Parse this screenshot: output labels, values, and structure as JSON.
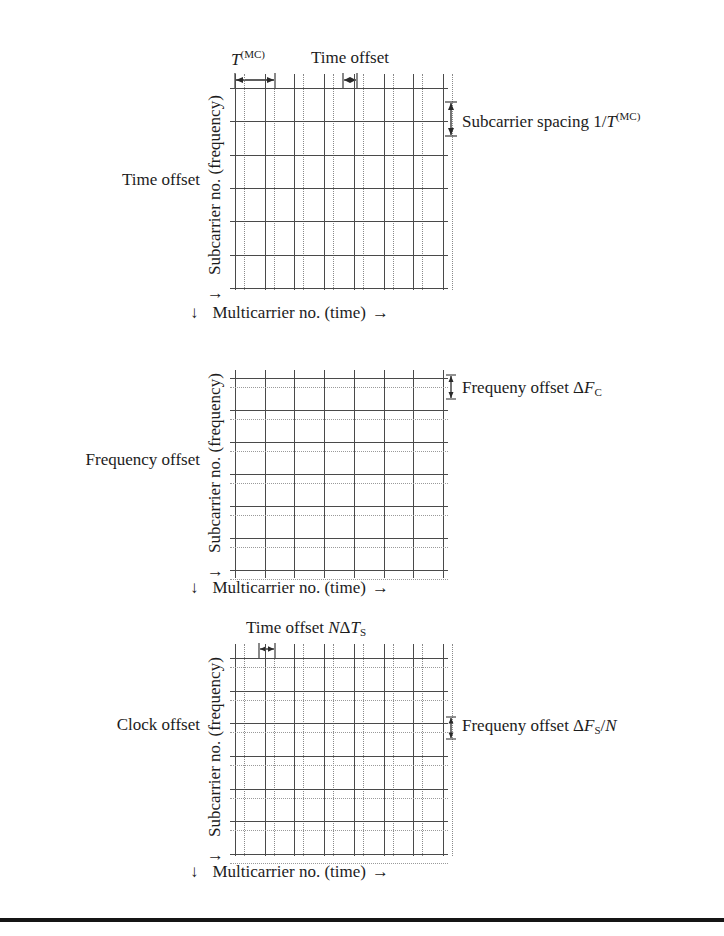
{
  "figure": {
    "domain": "technical-diagram",
    "ink_color": "#1c1c1c",
    "solid_line_color": "#4a4a4a",
    "dotted_line_color": "#9a9a9a"
  },
  "axes": {
    "y_label": "Subcarrier no. (frequency)",
    "y_arrow": "↓",
    "x_label": "Multicarrier no. (time)",
    "x_arrow_start": "↓",
    "x_arrow_end": "→"
  },
  "panels": [
    {
      "id": "time-offset",
      "row_caption": "Time offset",
      "top_left_label": "T",
      "top_left_label_sup": "(MC)",
      "top_center_label": "Time offset",
      "right_label_prefix": "Subcarrier spacing 1/",
      "right_label_italic": "T",
      "right_label_sup": "(MC)",
      "columns": 7,
      "rows": 6,
      "has_dotted_vertical": true,
      "has_dotted_horizontal": false
    },
    {
      "id": "frequency-offset",
      "row_caption": "Frequency offset",
      "right_label_prefix": "Frequeny offset Δ",
      "right_label_italic": "F",
      "right_label_sub": "C",
      "right_label_suffix": "",
      "columns": 7,
      "rows": 6,
      "has_dotted_vertical": false,
      "has_dotted_horizontal": true
    },
    {
      "id": "clock-offset",
      "row_caption": "Clock offset",
      "top_left_prefix": "Time offset ",
      "top_left_italic1": "N",
      "top_left_delta": "Δ",
      "top_left_italic2": "T",
      "top_left_sub": "S",
      "right_label_prefix": "Frequeny offset Δ",
      "right_label_italic": "F",
      "right_label_sub": "S",
      "right_label_suffix": "/",
      "right_label_italic2": "N",
      "columns": 7,
      "rows": 6,
      "has_dotted_vertical": true,
      "has_dotted_horizontal": true
    }
  ]
}
